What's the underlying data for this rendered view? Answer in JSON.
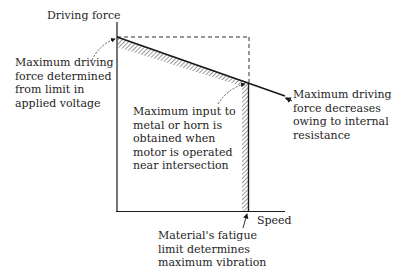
{
  "diagram": {
    "axes": {
      "y_label": "Driving force",
      "x_label": "Speed"
    },
    "annotations": [
      {
        "id": "voltage-limit",
        "text": "Maximum driving\nforce determined\nfrom limit in\napplied voltage"
      },
      {
        "id": "internal-resistance",
        "text": "Maximum driving\nforce decreases\nowing to internal\nresistance"
      },
      {
        "id": "max-input",
        "text": "Maximum input to\nmetal or horn is\nobtained when\nmotor is operated\nnear intersection"
      },
      {
        "id": "fatigue-limit",
        "text": "Material's fatigue\nlimit determines\nmaximum vibration"
      }
    ],
    "colors": {
      "line": "#1a1a1a",
      "hatch": "#555555",
      "background": "#ffffff"
    }
  }
}
